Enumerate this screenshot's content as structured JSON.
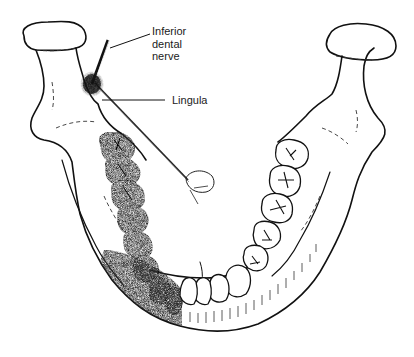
{
  "diagram": {
    "labels": {
      "inferior_dental_nerve": "Inferior\ndental\nnerve",
      "lingula": "Lingula"
    },
    "colors": {
      "line": "#111111",
      "shading": "#2b2b2b",
      "background": "#ffffff"
    }
  }
}
